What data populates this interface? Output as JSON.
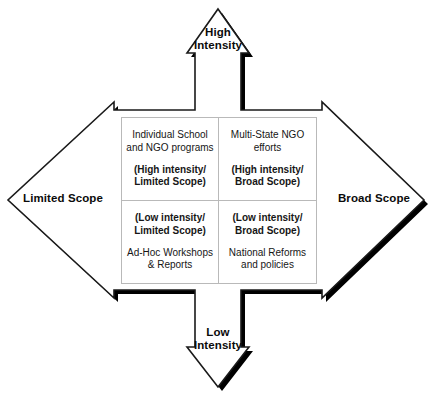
{
  "diagram": {
    "title_implicit": "Intensity vs Scope quadrant matrix",
    "colors": {
      "outline": "#1a1a1a",
      "shadow": "#000000",
      "grid_line": "#b9b9b9",
      "text": "#161616",
      "background": "#ffffff"
    },
    "axes": {
      "top": {
        "name": "high-intensity",
        "label": "High\nIntensity",
        "direction": "up"
      },
      "bottom": {
        "name": "low-intensity",
        "label": "Low\nIntensity",
        "direction": "down"
      },
      "left": {
        "name": "limited-scope",
        "label": "Limited Scope",
        "direction": "left"
      },
      "right": {
        "name": "broad-scope",
        "label": "Broad Scope",
        "direction": "right"
      }
    },
    "quadrants": [
      {
        "key": "high-intensity-limited-scope",
        "position": "top-left",
        "example": "Individual School\nand NGO programs",
        "classification": "(High intensity/\nLimited Scope)",
        "order": "example-first"
      },
      {
        "key": "high-intensity-broad-scope",
        "position": "top-right",
        "example": "Multi-State NGO\nefforts",
        "classification": "(High intensity/\nBroad Scope)",
        "order": "example-first"
      },
      {
        "key": "low-intensity-limited-scope",
        "position": "bottom-left",
        "classification": "(Low intensity/\nLimited Scope)",
        "example": "Ad-Hoc Workshops\n& Reports",
        "order": "classification-first"
      },
      {
        "key": "low-intensity-broad-scope",
        "position": "bottom-right",
        "classification": "(Low intensity/\nBroad Scope)",
        "example": "National Reforms\nand policies",
        "order": "classification-first"
      }
    ]
  }
}
